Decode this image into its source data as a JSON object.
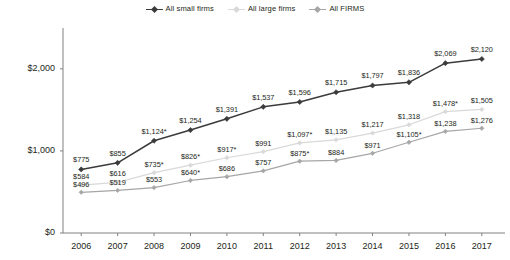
{
  "legend": {
    "position": "top-center",
    "entries": [
      {
        "label": "All small firms",
        "color": "#3b3b3b",
        "marker": "diamond"
      },
      {
        "label": "All large firms",
        "color": "#d9d9d9",
        "marker": "diamond"
      },
      {
        "label": "All FIRMS",
        "color": "#a6a6a6",
        "marker": "diamond"
      }
    ]
  },
  "axes": {
    "y_ticks": [
      "$0",
      "$1,000",
      "$2,000"
    ],
    "x_ticks": [
      "2006",
      "2007",
      "2008",
      "2009",
      "2010",
      "2011",
      "2012",
      "2013",
      "2014",
      "2015",
      "2016",
      "2017"
    ]
  },
  "chart_data": {
    "type": "line",
    "title": "",
    "xlabel": "",
    "ylabel": "",
    "ylim": [
      0,
      2400
    ],
    "grid": false,
    "legend_position": "top-center",
    "categories": [
      "2006",
      "2007",
      "2008",
      "2009",
      "2010",
      "2011",
      "2012",
      "2013",
      "2014",
      "2015",
      "2016",
      "2017"
    ],
    "series": [
      {
        "name": "All small firms",
        "color": "#3b3b3b",
        "values": [
          775,
          855,
          1124,
          1254,
          1391,
          1537,
          1596,
          1715,
          1797,
          1836,
          2069,
          2120
        ],
        "labels": [
          "$775",
          "$855",
          "$1,124*",
          "$1,254",
          "$1,391",
          "$1,537",
          "$1,596",
          "$1,715",
          "$1,797",
          "$1,836",
          "$2,069",
          "$2,120"
        ]
      },
      {
        "name": "All large firms",
        "color": "#d9d9d9",
        "values": [
          584,
          616,
          735,
          826,
          917,
          991,
          1097,
          1135,
          1217,
          1318,
          1478,
          1505
        ],
        "labels": [
          "$584",
          "$616",
          "$735*",
          "$826*",
          "$917*",
          "$991",
          "$1,097*",
          "$1,135",
          "$1,217",
          "$1,318",
          "$1,478*",
          "$1,505"
        ]
      },
      {
        "name": "All FIRMS",
        "color": "#a6a6a6",
        "values": [
          496,
          519,
          553,
          640,
          686,
          757,
          875,
          884,
          971,
          1105,
          1238,
          1276
        ],
        "labels": [
          "$496",
          "$519",
          "$553",
          "$640*",
          "$686",
          "$757",
          "$875*",
          "$884",
          "$971",
          "$1,105*",
          "$1,238",
          "$1,276"
        ]
      }
    ]
  }
}
